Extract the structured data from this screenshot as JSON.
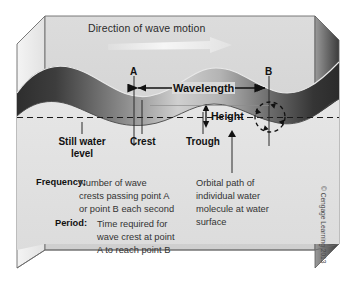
{
  "figure": {
    "title_text": "Direction of wave motion",
    "copyright": "© Cengage Learning 2013"
  },
  "wave_markers": {
    "point_a": "A",
    "point_b": "B"
  },
  "dimensions": {
    "wavelength": "Wavelength",
    "height": "Height"
  },
  "surface_labels": {
    "still_water_level": "Still water\nlevel",
    "crest": "Crest",
    "trough": "Trough"
  },
  "definitions": {
    "frequency_term": "Frequency:",
    "frequency_text": "Number of wave\ncrests passing point A\nor point B each second",
    "period_term": "Period:",
    "period_text": "Time required for\nwave crest at point\nA to reach point B"
  },
  "callouts": {
    "orbital_path": "Orbital path of\nindividual water\nmolecule at water\nsurface"
  },
  "colors": {
    "box_face": "#d4d4d4",
    "water_dark": "#3a3a3a",
    "water_light": "#e8e8e8",
    "line": "#1a1a1a",
    "text": "#231f20"
  }
}
